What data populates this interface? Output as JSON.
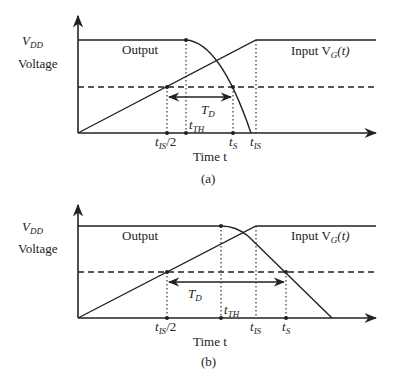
{
  "figure": {
    "panels": [
      {
        "id": "a",
        "caption": "(a)",
        "y_label": "Voltage",
        "vdd_label": "V",
        "vdd_sub": "DD",
        "output_label": "Output",
        "input_label": "Input V",
        "input_sub": "G",
        "input_suffix": "(t)",
        "x_label": "Time t",
        "td_label": "T",
        "td_sub": "D",
        "ticks": [
          {
            "main": "t",
            "sub": "IS",
            "suffix": "/2"
          },
          {
            "main": "t",
            "sub": "TH",
            "suffix": ""
          },
          {
            "main": "t",
            "sub": "S",
            "suffix": ""
          },
          {
            "main": "t",
            "sub": "IS",
            "suffix": ""
          }
        ]
      },
      {
        "id": "b",
        "caption": "(b)",
        "y_label": "Voltage",
        "vdd_label": "V",
        "vdd_sub": "DD",
        "output_label": "Output",
        "input_label": "Input V",
        "input_sub": "G",
        "input_suffix": "(t)",
        "x_label": "Time t",
        "td_label": "T",
        "td_sub": "D",
        "ticks": [
          {
            "main": "t",
            "sub": "IS",
            "suffix": "/2"
          },
          {
            "main": "t",
            "sub": "TH",
            "suffix": ""
          },
          {
            "main": "t",
            "sub": "IS",
            "suffix": ""
          },
          {
            "main": "t",
            "sub": "S",
            "suffix": ""
          }
        ]
      }
    ]
  }
}
